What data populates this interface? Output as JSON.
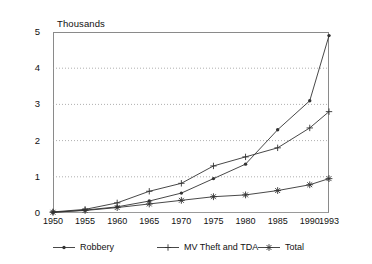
{
  "chart_data": {
    "type": "line",
    "title": "",
    "subtitle": "",
    "xlabel": "",
    "ylabel": "Thousands",
    "unit_label": "Thousands",
    "x": [
      1950,
      1955,
      1960,
      1965,
      1970,
      1975,
      1980,
      1985,
      1990,
      1993
    ],
    "xtick_labels": [
      "1950",
      "1955",
      "1960",
      "1965",
      "1970",
      "1975",
      "1980",
      "1985",
      "1990",
      "1993"
    ],
    "ytick_labels": [
      "0",
      "1",
      "2",
      "3",
      "4",
      "5"
    ],
    "ytick_values": [
      0,
      1,
      2,
      3,
      4,
      5
    ],
    "ylim": [
      0,
      5
    ],
    "xlim": [
      1950,
      1993
    ],
    "grid": "horizontal-dotted",
    "legend_position": "bottom",
    "series": [
      {
        "name": "Robbery",
        "marker": "dot",
        "values": [
          0.02,
          0.08,
          0.17,
          0.33,
          0.55,
          0.95,
          1.35,
          2.3,
          3.1,
          4.9
        ]
      },
      {
        "name": "MV Theft and TDA",
        "marker": "plus",
        "values": [
          0.03,
          0.1,
          0.28,
          0.6,
          0.82,
          1.3,
          1.55,
          1.8,
          2.35,
          2.8
        ]
      },
      {
        "name": "Total",
        "marker": "asterisk",
        "values": [
          0.02,
          0.07,
          0.15,
          0.25,
          0.35,
          0.45,
          0.5,
          0.62,
          0.78,
          0.95
        ]
      }
    ]
  },
  "legend": {
    "items": [
      {
        "label": "Robbery",
        "marker": "dot"
      },
      {
        "label": "MV Theft and TDA",
        "marker": "plus"
      },
      {
        "label": "Total",
        "marker": "asterisk"
      }
    ]
  },
  "colors": {
    "line": "#333333",
    "axis": "#8a8a8a",
    "grid": "#9a9a9a",
    "text": "#111111",
    "background": "#ffffff"
  }
}
